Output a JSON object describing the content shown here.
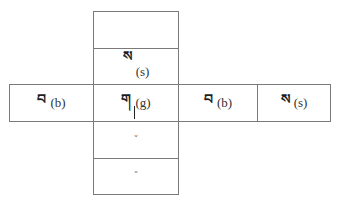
{
  "diagram": {
    "type": "cross-shaped letter grid",
    "column": [
      {
        "id": "top-empty",
        "tibetan": "",
        "latin": ""
      },
      {
        "id": "superscript",
        "tibetan": "ས",
        "latin": "(s)"
      },
      {
        "id": "root",
        "tibetan": "ག",
        "latin": "(g)"
      },
      {
        "id": "subscript-1",
        "tibetan": "",
        "latin": "",
        "mark": "ˇ"
      },
      {
        "id": "subscript-2",
        "tibetan": "",
        "latin": "",
        "mark": "ˇ"
      }
    ],
    "row": [
      {
        "id": "prefix",
        "tibetan": "བ",
        "latin": "(b)"
      },
      {
        "id": "root",
        "tibetan": "ག",
        "latin": "(g)"
      },
      {
        "id": "suffix",
        "tibetan": "བ",
        "latin": "(b)"
      },
      {
        "id": "post-suffix",
        "tibetan": "ས",
        "latin": "(s)"
      }
    ]
  }
}
